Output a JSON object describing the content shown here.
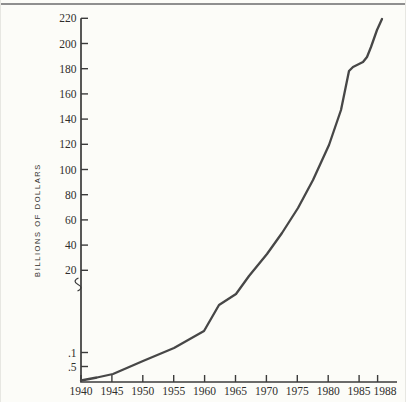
{
  "page": {
    "background": "#fcfcf8",
    "top_rule_color": "#8f8f8f"
  },
  "chart_data": {
    "type": "line",
    "title": "",
    "xlabel": "",
    "ylabel": "BILLIONS OF DOLLARS",
    "x_tick_labels": [
      "1940",
      "1945",
      "1950",
      "1955",
      "1960",
      "1965",
      "1970",
      "1975",
      "1980",
      "1985",
      "1988"
    ],
    "y_tick_labels_upper": [
      "220",
      "200",
      "180",
      "160",
      "140",
      "120",
      "100",
      "80",
      "60",
      "40",
      "20"
    ],
    "y_tick_labels_lower": [
      ".1",
      ".5"
    ],
    "axis_break": true,
    "grid": false,
    "legend": false,
    "x_range": [
      1940,
      1988
    ],
    "y_range_upper": [
      20,
      220
    ],
    "line_color": "#474747",
    "series": [
      {
        "name": "expenditures",
        "x": [
          1940,
          1945,
          1950,
          1955,
          1960,
          1965,
          1970,
          1975,
          1980,
          1982,
          1984,
          1985,
          1986,
          1987,
          1988
        ],
        "values": [
          0.05,
          0.3,
          1,
          5,
          11,
          17.5,
          33,
          69,
          120,
          150,
          178,
          181,
          185,
          200,
          218
        ]
      }
    ]
  },
  "layout": {
    "plot": {
      "axis_color": "#3b3b3b",
      "text_color": "#2f2e2c",
      "x_axis": {
        "y": 382,
        "x0": 80,
        "x1": 396,
        "tick_xs": [
          80,
          110.9,
          141.8,
          172.7,
          203.6,
          234.5,
          265.4,
          296.3,
          327.2,
          358.1,
          376.6
        ],
        "last_label_dx": 7.5,
        "label_y": 395
      },
      "y_axis": {
        "x": 80,
        "y0": 18.3,
        "y1": 382,
        "upper_tick_ys": [
          18.3,
          43.5,
          68.7,
          93.9,
          119.1,
          144.3,
          169.5,
          194.7,
          219.9,
          245.1,
          270.3
        ],
        "lower_tick_ys": [
          352.5,
          366.5
        ],
        "label_x": 75.5,
        "break_y": 285
      },
      "tick_len": 7,
      "curve_px": [
        [
          80,
          380.5
        ],
        [
          96,
          377.5
        ],
        [
          112,
          374
        ],
        [
          142,
          361
        ],
        [
          173,
          348
        ],
        [
          203,
          331
        ],
        [
          218,
          305
        ],
        [
          235,
          294
        ],
        [
          248,
          276
        ],
        [
          266,
          254
        ],
        [
          281,
          233
        ],
        [
          297,
          208
        ],
        [
          312,
          180
        ],
        [
          328,
          145
        ],
        [
          340,
          110
        ],
        [
          348,
          71
        ],
        [
          352,
          67
        ],
        [
          356,
          65
        ],
        [
          362,
          62
        ],
        [
          366,
          57
        ],
        [
          370,
          47
        ],
        [
          376,
          30
        ],
        [
          381,
          19
        ]
      ]
    }
  }
}
